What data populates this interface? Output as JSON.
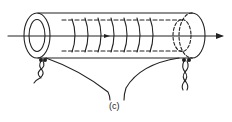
{
  "figure": {
    "label": "(c)",
    "stroke_color": "#222222",
    "background": "#ffffff"
  }
}
